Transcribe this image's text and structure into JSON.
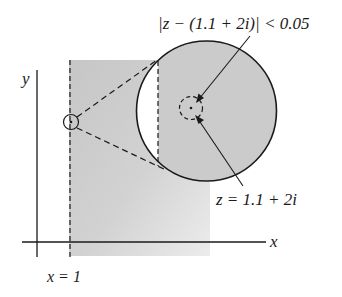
{
  "diagram": {
    "axes": {
      "x_label": "x",
      "y_label": "y"
    },
    "vertical_line_label": "x = 1",
    "point_label": "z = 1.1 + 2i",
    "neighborhood_label": "|z − (1.1 + 2i)| < 0.05",
    "colors": {
      "ink": "#1a1a1a",
      "shade": "#c9c9c9",
      "shade_light": "#e9e9e9",
      "background": "#ffffff"
    },
    "elements": [
      "half-plane region x > 1 (shaded)",
      "dashed vertical line x = 1",
      "small circle at point z = 1.1 + 2i",
      "dashed cone lines to magnified view",
      "magnified disk",
      "dashed neighborhood circle radius 0.05"
    ]
  }
}
